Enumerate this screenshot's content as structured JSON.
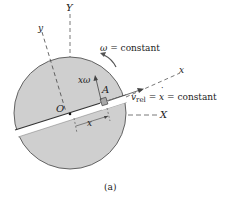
{
  "figure": {
    "caption": "(a)",
    "colors": {
      "disk_fill": "#cfcfcf",
      "disk_stroke": "#555555",
      "slot_fill": "#ffffff",
      "slot_edge": "#333333",
      "block_fill": "#a8a8a8",
      "axis_dash": "#555555",
      "text": "#222222"
    },
    "labels": {
      "Y_axis": "Y",
      "y_axis": "y",
      "X_axis": "X",
      "x_axis": "x",
      "origin": "O",
      "point": "A",
      "omega_symbol": "ω",
      "omega_rest": " = constant",
      "vrel_v": "v",
      "vrel_sub": "rel",
      "vrel_eq": " = ",
      "vrel_xdot": "x",
      "vrel_rest": " = constant",
      "x_omega": "xω",
      "x_distance": "x"
    }
  }
}
